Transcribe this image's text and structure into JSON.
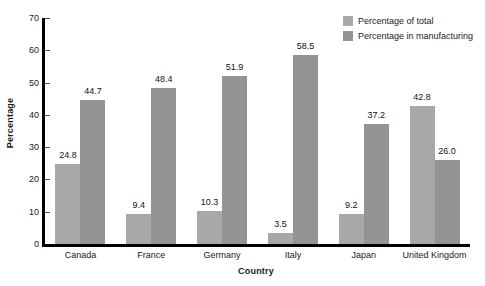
{
  "chart_data": {
    "type": "bar",
    "title": "",
    "subtitle": "",
    "xlabel": "Country",
    "ylabel": "Percentage",
    "categories": [
      "Canada",
      "France",
      "Germany",
      "Italy",
      "Japan",
      "United Kingdom"
    ],
    "series": [
      {
        "name": "Percentage of total",
        "color": "#a8a8a8",
        "values": [
          24.8,
          9.4,
          10.3,
          3.5,
          9.2,
          42.8
        ],
        "labels": [
          "24.8",
          "9.4",
          "10.3",
          "3.5",
          "9.2",
          "42.8"
        ]
      },
      {
        "name": "Percentage in manufacturing",
        "color": "#949494",
        "values": [
          44.7,
          48.4,
          51.9,
          58.5,
          37.2,
          26.0
        ],
        "labels": [
          "44.7",
          "48.4",
          "51.9",
          "58.5",
          "37.2",
          "26.0"
        ]
      }
    ],
    "ylim": [
      0,
      70
    ],
    "ytick_values": [
      0,
      10,
      20,
      30,
      40,
      50,
      60,
      70
    ],
    "ytick_labels": [
      "0",
      "10",
      "20",
      "30",
      "40",
      "50",
      "60",
      "70"
    ],
    "grid": false,
    "legend_position": "top-right",
    "data_labels": true,
    "axis_color": "#000000",
    "background": "#ffffff"
  }
}
